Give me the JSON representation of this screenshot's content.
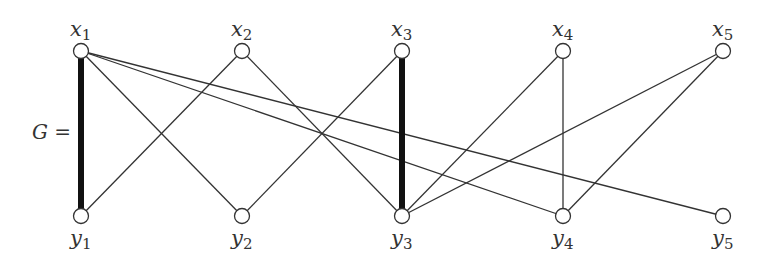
{
  "graph": {
    "label": "G =",
    "type": "bipartite",
    "colors": {
      "line": "#333333",
      "node_fill": "#ffffff",
      "node_stroke": "#333333"
    },
    "top_nodes": [
      {
        "id": "x1",
        "name": "x",
        "sub": "1",
        "x": 81,
        "y": 51
      },
      {
        "id": "x2",
        "name": "x",
        "sub": "2",
        "x": 242,
        "y": 51
      },
      {
        "id": "x3",
        "name": "x",
        "sub": "3",
        "x": 402,
        "y": 51
      },
      {
        "id": "x4",
        "name": "x",
        "sub": "4",
        "x": 563,
        "y": 51
      },
      {
        "id": "x5",
        "name": "x",
        "sub": "5",
        "x": 723,
        "y": 51
      }
    ],
    "bottom_nodes": [
      {
        "id": "y1",
        "name": "y",
        "sub": "1",
        "x": 81,
        "y": 216
      },
      {
        "id": "y2",
        "name": "y",
        "sub": "2",
        "x": 242,
        "y": 216
      },
      {
        "id": "y3",
        "name": "y",
        "sub": "3",
        "x": 402,
        "y": 216
      },
      {
        "id": "y4",
        "name": "y",
        "sub": "4",
        "x": 563,
        "y": 216
      },
      {
        "id": "y5",
        "name": "y",
        "sub": "5",
        "x": 723,
        "y": 216
      }
    ],
    "edges": [
      {
        "from": "x1",
        "to": "y1",
        "thick": true
      },
      {
        "from": "x1",
        "to": "y2",
        "thick": false
      },
      {
        "from": "x1",
        "to": "y4",
        "thick": false
      },
      {
        "from": "x1",
        "to": "y5",
        "thick": false
      },
      {
        "from": "x2",
        "to": "y1",
        "thick": false
      },
      {
        "from": "x2",
        "to": "y3",
        "thick": false
      },
      {
        "from": "x3",
        "to": "y2",
        "thick": false
      },
      {
        "from": "x3",
        "to": "y3",
        "thick": true
      },
      {
        "from": "x4",
        "to": "y3",
        "thick": false
      },
      {
        "from": "x4",
        "to": "y4",
        "thick": false
      },
      {
        "from": "x5",
        "to": "y3",
        "thick": false
      },
      {
        "from": "x5",
        "to": "y4",
        "thick": false
      }
    ]
  }
}
